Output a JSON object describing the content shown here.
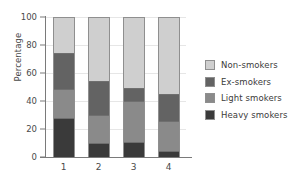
{
  "chart_data": {
    "type": "bar",
    "stacked": true,
    "title": "",
    "xlabel": "",
    "ylabel": "Percentage",
    "ylim": [
      0,
      100
    ],
    "yticks": [
      0,
      20,
      40,
      60,
      80,
      100
    ],
    "ytick_labels": [
      "0",
      "20",
      "40",
      "60",
      "80",
      "100"
    ],
    "categories": [
      "1",
      "2",
      "3",
      "4"
    ],
    "grid": true,
    "legend_position": "right",
    "series": [
      {
        "name": "Heavy smokers",
        "color": "#3a3a3a",
        "values": [
          28,
          10,
          11,
          4
        ]
      },
      {
        "name": "Light smokers",
        "color": "#8a8a8a",
        "values": [
          21,
          20,
          29,
          22
        ]
      },
      {
        "name": "Ex-smokers",
        "color": "#636363",
        "values": [
          26,
          25,
          10,
          19
        ]
      },
      {
        "name": "Non-smokers",
        "color": "#cfcfcf",
        "values": [
          25,
          45,
          50,
          55
        ]
      }
    ],
    "cumulative_tops": {
      "1": {
        "heavy": 28,
        "light": 49,
        "ex": 75,
        "non": 100
      },
      "2": {
        "heavy": 10,
        "light": 30,
        "ex": 55,
        "non": 100
      },
      "3": {
        "heavy": 11,
        "light": 40,
        "ex": 50,
        "non": 100
      },
      "4": {
        "heavy": 4,
        "light": 26,
        "ex": 45,
        "non": 100
      }
    }
  },
  "legend": {
    "items": [
      {
        "label": "Non-smokers",
        "color": "#cfcfcf"
      },
      {
        "label": "Ex-smokers",
        "color": "#636363"
      },
      {
        "label": "Light smokers",
        "color": "#8a8a8a"
      },
      {
        "label": "Heavy smokers",
        "color": "#3a3a3a"
      }
    ]
  },
  "colors": {
    "non_smokers": "#cfcfcf",
    "ex_smokers": "#636363",
    "light_smokers": "#8a8a8a",
    "heavy_smokers": "#3a3a3a",
    "axis": "#7a7a7a",
    "grid": "#e6e6e6",
    "text": "#3b3b3b",
    "background": "#ffffff"
  }
}
